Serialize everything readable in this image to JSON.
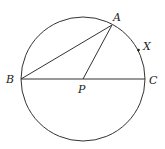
{
  "diagram": {
    "points": {
      "A": {
        "label": "A"
      },
      "B": {
        "label": "B"
      },
      "C": {
        "label": "C"
      },
      "P": {
        "label": "P"
      },
      "X": {
        "label": "X"
      }
    },
    "segments": [
      "BA",
      "PA",
      "BC"
    ],
    "colors": {
      "line": "#333333",
      "text": "#222222",
      "background": "#ffffff"
    }
  }
}
